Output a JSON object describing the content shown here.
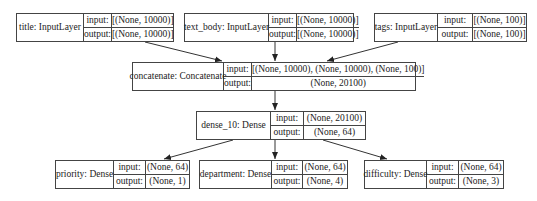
{
  "diagram": {
    "type": "keras-model-plot",
    "nodes": [
      {
        "id": "title",
        "label": "title: InputLayer",
        "input_label": "input:",
        "output_label": "output:",
        "input": "[(None, 10000)]",
        "output": "[(None, 10000)]"
      },
      {
        "id": "text_body",
        "label": "text_body: InputLayer",
        "input_label": "input:",
        "output_label": "output:",
        "input": "[(None, 10000)]",
        "output": "[(None, 10000)]"
      },
      {
        "id": "tags",
        "label": "tags: InputLayer",
        "input_label": "input:",
        "output_label": "output:",
        "input": "[(None, 100)]",
        "output": "[(None, 100)]"
      },
      {
        "id": "concatenate",
        "label": "concatenate: Concatenate",
        "input_label": "input:",
        "output_label": "output:",
        "input": "[(None, 10000), (None, 10000), (None, 100)]",
        "output": "(None, 20100)"
      },
      {
        "id": "dense_10",
        "label": "dense_10: Dense",
        "input_label": "input:",
        "output_label": "output:",
        "input": "(None, 20100)",
        "output": "(None, 64)"
      },
      {
        "id": "priority",
        "label": "priority: Dense",
        "input_label": "input:",
        "output_label": "output:",
        "input": "(None, 64)",
        "output": "(None, 1)"
      },
      {
        "id": "department",
        "label": "department: Dense",
        "input_label": "input:",
        "output_label": "output:",
        "input": "(None, 64)",
        "output": "(None, 4)"
      },
      {
        "id": "difficulty",
        "label": "difficulty: Dense",
        "input_label": "input:",
        "output_label": "output:",
        "input": "(None, 64)",
        "output": "(None, 3)"
      }
    ],
    "edges": [
      {
        "from": "title",
        "to": "concatenate"
      },
      {
        "from": "text_body",
        "to": "concatenate"
      },
      {
        "from": "tags",
        "to": "concatenate"
      },
      {
        "from": "concatenate",
        "to": "dense_10"
      },
      {
        "from": "dense_10",
        "to": "priority"
      },
      {
        "from": "dense_10",
        "to": "department"
      },
      {
        "from": "dense_10",
        "to": "difficulty"
      }
    ]
  }
}
